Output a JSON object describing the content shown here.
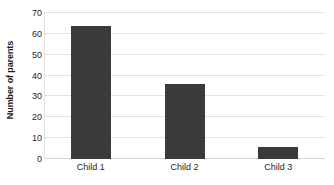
{
  "chart_data": {
    "type": "bar",
    "title": "",
    "subtitle": "",
    "categories": [
      "Child 1",
      "Child 2",
      "Child 3"
    ],
    "values": [
      64,
      36,
      6
    ],
    "series": [
      {
        "name": "Number of parents",
        "values": [
          64,
          36,
          6
        ]
      }
    ],
    "xlabel": "",
    "ylabel": "Number of parents",
    "ylim": [
      0,
      70
    ],
    "yticks": [
      0,
      10,
      20,
      30,
      40,
      50,
      60,
      70
    ],
    "ytick_labels": [
      "0",
      "10",
      "20",
      "30",
      "40",
      "50",
      "60",
      "70"
    ],
    "grid": "horizontal",
    "legend": "none",
    "colors": {
      "bar": "#3a3a3a",
      "gridline": "#e2e2e2",
      "axis": "#d4d4d4",
      "text": "#262626",
      "background": "#ffffff"
    }
  }
}
